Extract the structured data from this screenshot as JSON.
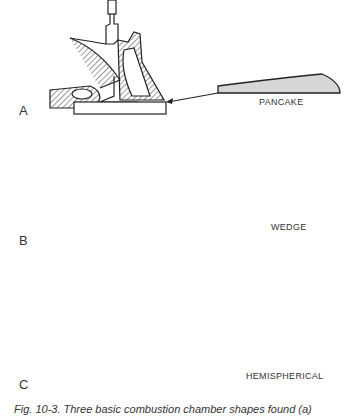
{
  "figure": {
    "panels": [
      {
        "letter": "A",
        "shape": "PANCAKE"
      },
      {
        "letter": "B",
        "shape": "WEDGE"
      },
      {
        "letter": "C",
        "shape": "HEMISPHERICAL"
      }
    ],
    "caption": "Fig. 10-3. Three basic combustion chamber shapes found (a)"
  },
  "colors": {
    "fill": "#d6d6d6",
    "ink": "#222222",
    "hatch": "#333333"
  }
}
